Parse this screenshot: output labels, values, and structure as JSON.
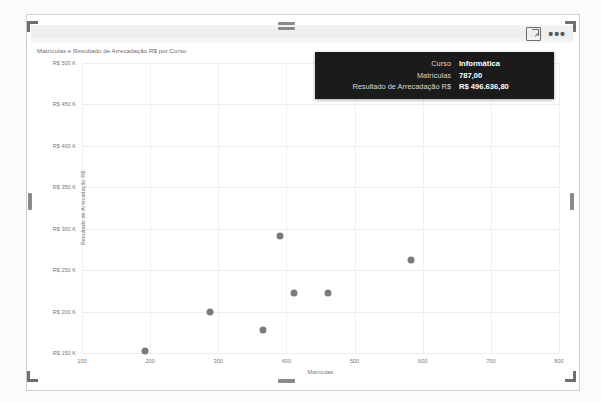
{
  "visual": {
    "title": "Matrículas e Resultado de Arrecadação R$ por Curso",
    "header_icons": {
      "focus_mode": "focus-mode-icon",
      "more_options": "•••"
    }
  },
  "tooltip": {
    "rows": [
      {
        "label": "Curso",
        "value": "Informática"
      },
      {
        "label": "Matrículas",
        "value": "787,00"
      },
      {
        "label": "Resultado de Arrecadação R$",
        "value": "R$ 496.636,80"
      }
    ]
  },
  "chart_data": {
    "type": "scatter",
    "title": "Matrículas e Resultado de Arrecadação R$ por Curso",
    "xlabel": "Matrículas",
    "ylabel": "Resultado de Arrecadação R$",
    "xlim": [
      100,
      800
    ],
    "ylim": [
      150000,
      500000
    ],
    "xticks": [
      100,
      200,
      300,
      400,
      500,
      600,
      700,
      800
    ],
    "xticklabels": [
      "100",
      "200",
      "300",
      "400",
      "500",
      "600",
      "700",
      "800"
    ],
    "yticks": [
      150000,
      200000,
      250000,
      300000,
      350000,
      400000,
      450000,
      500000
    ],
    "yticklabels": [
      "R$ 150 K",
      "R$ 200 K",
      "R$ 250 K",
      "R$ 300 K",
      "R$ 350 K",
      "R$ 400 K",
      "R$ 450 K",
      "R$ 500 K"
    ],
    "grid": true,
    "legend": "none",
    "marker_color": "#7b7b7b",
    "points": [
      {
        "x": 193,
        "y": 152000,
        "label": ""
      },
      {
        "x": 288,
        "y": 199000,
        "label": ""
      },
      {
        "x": 366,
        "y": 178000,
        "label": ""
      },
      {
        "x": 390,
        "y": 291000,
        "label": ""
      },
      {
        "x": 411,
        "y": 223000,
        "label": ""
      },
      {
        "x": 461,
        "y": 223000,
        "label": ""
      },
      {
        "x": 583,
        "y": 262000,
        "label": ""
      },
      {
        "x": 787,
        "y": 496636.8,
        "label": "Informática"
      }
    ]
  },
  "colors": {
    "marker": "#7b7b7b",
    "tooltip_bg": "#1b1b1b",
    "grid": "#ededed",
    "axis_text": "#7a7a7a"
  }
}
